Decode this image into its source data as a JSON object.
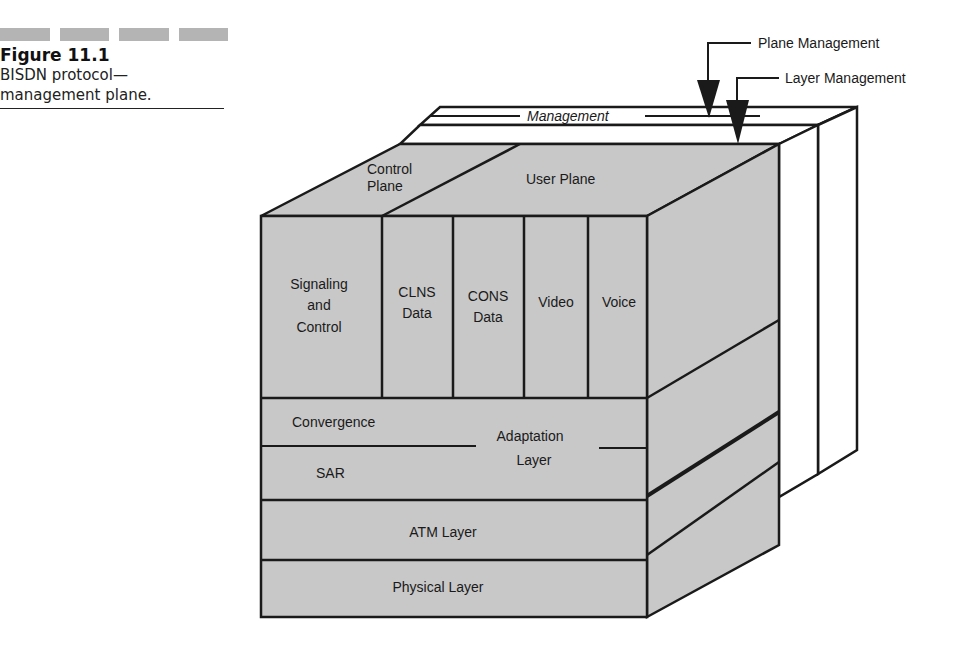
{
  "caption": {
    "figure_number": "Figure 11.1",
    "line1": "BISDN protocol—",
    "line2": "management plane."
  },
  "diagram": {
    "callouts": {
      "plane_management": "Plane  Management",
      "layer_management": "Layer Management"
    },
    "management_label": "Management",
    "top_face": {
      "control_plane_line1": "Control",
      "control_plane_line2": "Plane",
      "user_plane": "User Plane"
    },
    "higher_layers": {
      "signaling": [
        "Signaling",
        "and",
        "Control"
      ],
      "clns": [
        "CLNS",
        "Data"
      ],
      "cons": [
        "CONS",
        "Data"
      ],
      "video": "Video",
      "voice": "Voice"
    },
    "adaptation_layer": {
      "convergence": "Convergence",
      "sar": "SAR",
      "label_line1": "Adaptation",
      "label_line2": "Layer"
    },
    "atm_layer": "ATM Layer",
    "physical_layer": "Physical Layer",
    "colors": {
      "face_fill": "#c8c8c8",
      "management_fill": "#ffffff",
      "stroke": "#1a1a1a"
    }
  }
}
